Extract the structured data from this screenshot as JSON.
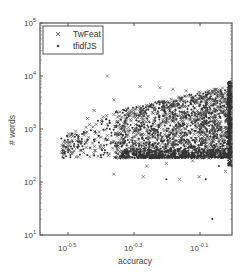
{
  "chart_data": {
    "type": "scatter",
    "title": "",
    "xlabel": "accuracy",
    "ylabel": "# words",
    "xscale": "log",
    "yscale": "log",
    "xlim_log10": [
      -0.585,
      0.0
    ],
    "ylim_log10": [
      1,
      5
    ],
    "x_ticks": [
      {
        "base": "10",
        "exp": "-0.5",
        "log10": -0.5
      },
      {
        "base": "10",
        "exp": "-0.3",
        "log10": -0.3
      },
      {
        "base": "10",
        "exp": "-0.1",
        "log10": -0.1
      }
    ],
    "y_ticks": [
      {
        "base": "10",
        "exp": "1",
        "log10": 1
      },
      {
        "base": "10",
        "exp": "2",
        "log10": 2
      },
      {
        "base": "10",
        "exp": "3",
        "log10": 3
      },
      {
        "base": "10",
        "exp": "4",
        "log10": 4
      },
      {
        "base": "10",
        "exp": "5",
        "log10": 5
      }
    ],
    "grid": false,
    "legend_position": "upper-left",
    "series": [
      {
        "name": "TwFeat",
        "marker": "x",
        "color": "#555555",
        "description": "Thousands of points; dense cluster for accuracy 10^-0.3 to 10^0 and #words 10^2.4 to 10^3.8; sparse points up to ~10^4 and down to ~10^2 for lower accuracies",
        "sample_points_log10": [
          [
            -0.38,
            4.0
          ],
          [
            -0.36,
            3.55
          ],
          [
            -0.42,
            3.35
          ],
          [
            -0.44,
            3.2
          ],
          [
            -0.28,
            3.8
          ],
          [
            -0.22,
            3.78
          ],
          [
            -0.18,
            3.75
          ],
          [
            -0.14,
            3.72
          ],
          [
            -0.1,
            3.7
          ],
          [
            -0.07,
            3.72
          ],
          [
            -0.3,
            3.3
          ],
          [
            -0.33,
            3.1
          ],
          [
            -0.35,
            2.9
          ],
          [
            -0.4,
            2.7
          ],
          [
            -0.46,
            2.75
          ],
          [
            -0.5,
            2.6
          ],
          [
            -0.32,
            2.5
          ],
          [
            -0.26,
            2.3
          ],
          [
            -0.2,
            2.35
          ],
          [
            -0.12,
            2.4
          ],
          [
            -0.09,
            2.45
          ],
          [
            -0.04,
            2.5
          ],
          [
            -0.36,
            2.15
          ],
          [
            -0.27,
            2.1
          ],
          [
            -0.16,
            2.05
          ],
          [
            -0.1,
            2.1
          ],
          [
            -0.02,
            2.2
          ]
        ]
      },
      {
        "name": "tfidfJS",
        "marker": ".",
        "color": "#333333",
        "description": "Thousands of points; heavy overlap with TwFeat cluster; dense vertical band near accuracy 10^0 (right edge); outlier near (10^-0.06, 10^1.3)",
        "sample_points_log10": [
          [
            -0.46,
            2.6
          ],
          [
            -0.42,
            2.5
          ],
          [
            -0.38,
            2.55
          ],
          [
            -0.34,
            2.45
          ],
          [
            -0.3,
            2.6
          ],
          [
            -0.24,
            2.7
          ],
          [
            -0.18,
            2.9
          ],
          [
            -0.12,
            3.1
          ],
          [
            -0.06,
            3.3
          ],
          [
            -0.01,
            3.6
          ],
          [
            -0.2,
            2.05
          ],
          [
            -0.08,
            2.05
          ],
          [
            -0.04,
            2.3
          ],
          [
            -0.06,
            1.3
          ],
          [
            -0.01,
            2.9
          ]
        ]
      }
    ]
  },
  "legend": {
    "items": [
      {
        "label": "TwFeat",
        "marker": "x"
      },
      {
        "label": "tfidfJS",
        "marker": "dot"
      }
    ]
  },
  "axes": {
    "xlabel": "accuracy",
    "ylabel": "# words",
    "x_ticks": [
      {
        "base": "10",
        "exp": "-0.5"
      },
      {
        "base": "10",
        "exp": "-0.3"
      },
      {
        "base": "10",
        "exp": "-0.1"
      }
    ],
    "y_ticks": [
      {
        "base": "10",
        "exp": "5"
      },
      {
        "base": "10",
        "exp": "4"
      },
      {
        "base": "10",
        "exp": "3"
      },
      {
        "base": "10",
        "exp": "2"
      },
      {
        "base": "10",
        "exp": "1"
      }
    ]
  },
  "colors": {
    "frame": "#555555",
    "marker": "#4a4a4a",
    "text": "#444444"
  }
}
